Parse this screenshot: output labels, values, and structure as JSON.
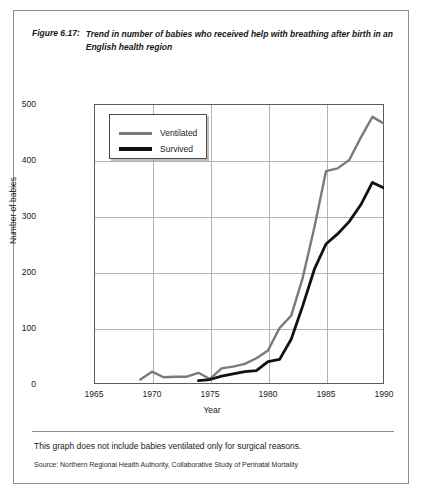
{
  "figure": {
    "number": "Figure 6.17:",
    "title": "Trend in number of babies who received help with breathing after birth in an English health region",
    "footnote": "This graph does not include babies ventilated only for surgical reasons.",
    "source": "Source: Northern Regional Health Authority, Collaborative Study of Perinatal Mortality"
  },
  "chart_data": {
    "type": "line",
    "title": "Trend in number of babies who received help with breathing after birth in an English health region",
    "xlabel": "Year",
    "ylabel": "Number of babies",
    "xlim": [
      1965,
      1990
    ],
    "ylim": [
      0,
      500
    ],
    "xticks": [
      1965,
      1970,
      1975,
      1980,
      1985,
      1990
    ],
    "yticks": [
      0,
      100,
      200,
      300,
      400,
      500
    ],
    "grid": true,
    "legend_position": "upper-left-inside",
    "colors": {
      "ventilated": "#7a7a7a",
      "survived": "#111111",
      "gridline": "#b4b4b4",
      "axis": "#5a5a5a"
    },
    "series": [
      {
        "name": "Ventilated",
        "color": "#7a7a7a",
        "x": [
          1969,
          1970,
          1971,
          1972,
          1973,
          1974,
          1975,
          1976,
          1977,
          1978,
          1979,
          1980,
          1981,
          1982,
          1983,
          1984,
          1985,
          1986,
          1987,
          1988,
          1989,
          1990
        ],
        "values": [
          8,
          22,
          12,
          13,
          13,
          20,
          9,
          28,
          31,
          36,
          46,
          60,
          100,
          122,
          190,
          280,
          380,
          385,
          400,
          440,
          477,
          465
        ]
      },
      {
        "name": "Survived",
        "color": "#111111",
        "x": [
          1974,
          1975,
          1976,
          1977,
          1978,
          1979,
          1980,
          1981,
          1982,
          1983,
          1984,
          1985,
          1986,
          1987,
          1988,
          1989,
          1990
        ],
        "values": [
          6,
          8,
          14,
          18,
          22,
          24,
          40,
          44,
          80,
          140,
          205,
          250,
          268,
          290,
          320,
          360,
          350
        ]
      }
    ]
  },
  "legend": {
    "items": [
      {
        "label": "Ventilated",
        "color": "#7a7a7a"
      },
      {
        "label": "Survived",
        "color": "#111111"
      }
    ]
  },
  "axes": {
    "y_title": "Number of babies",
    "x_title": "Year",
    "y_tick_labels": [
      "0",
      "100",
      "200",
      "300",
      "400",
      "500"
    ],
    "x_tick_labels": [
      "1965",
      "1970",
      "1975",
      "1980",
      "1985",
      "1990"
    ]
  }
}
